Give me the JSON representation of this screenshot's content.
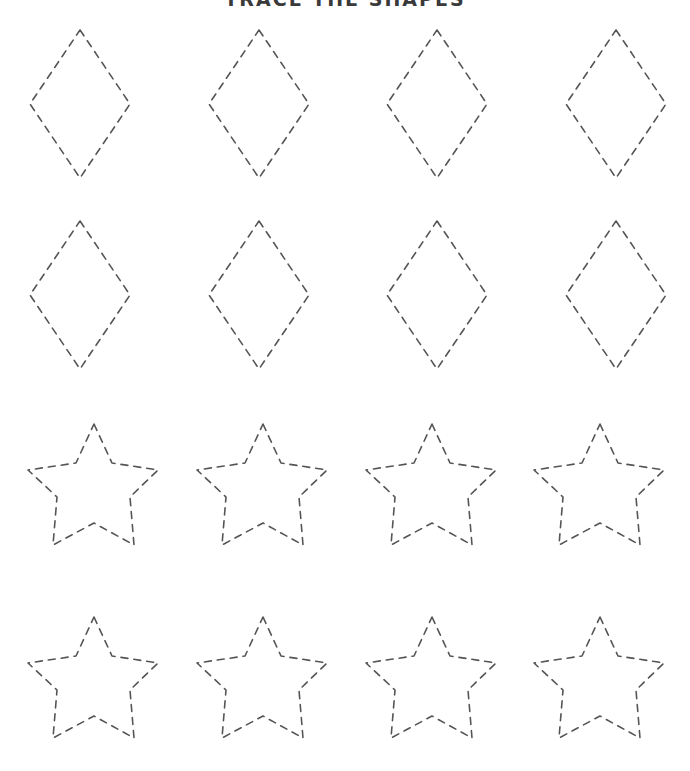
{
  "worksheet": {
    "title": "TRACE THE SHAPES",
    "stroke_color": "#555555",
    "rows": [
      {
        "shape": "diamond",
        "count": 4
      },
      {
        "shape": "diamond",
        "count": 4
      },
      {
        "shape": "star",
        "count": 4
      },
      {
        "shape": "star",
        "count": 4
      }
    ]
  }
}
